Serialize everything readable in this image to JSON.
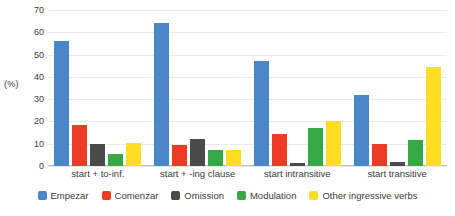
{
  "chart_data": {
    "type": "bar",
    "title": "",
    "subtitle": "",
    "xlabel": "",
    "ylabel": "(%)",
    "ylim": [
      0,
      70
    ],
    "yticks": [
      0,
      10,
      20,
      30,
      40,
      50,
      60,
      70
    ],
    "ytick_labels": [
      "0",
      "10",
      "20",
      "30",
      "40",
      "50",
      "60",
      "70"
    ],
    "grid": true,
    "legend_position": "bottom",
    "categories": [
      "start + to-inf.",
      "start + -ing clause",
      "start intransitive",
      "start transitive"
    ],
    "series": [
      {
        "name": "Empezar",
        "color": "#4a86c8",
        "values": [
          56.0,
          64.0,
          47.0,
          32.0
        ]
      },
      {
        "name": "Comenzar",
        "color": "#ee3b26",
        "values": [
          18.5,
          9.3,
          14.3,
          10.0
        ]
      },
      {
        "name": "Omission",
        "color": "#4a4a4a",
        "values": [
          10.0,
          12.0,
          1.2,
          1.7
        ]
      },
      {
        "name": "Modulation",
        "color": "#36a845",
        "values": [
          5.2,
          7.2,
          17.2,
          11.7
        ]
      },
      {
        "name": "Other ingressive verbs",
        "color": "#ffdd22",
        "values": [
          10.5,
          7.2,
          20.0,
          44.3
        ]
      }
    ]
  }
}
